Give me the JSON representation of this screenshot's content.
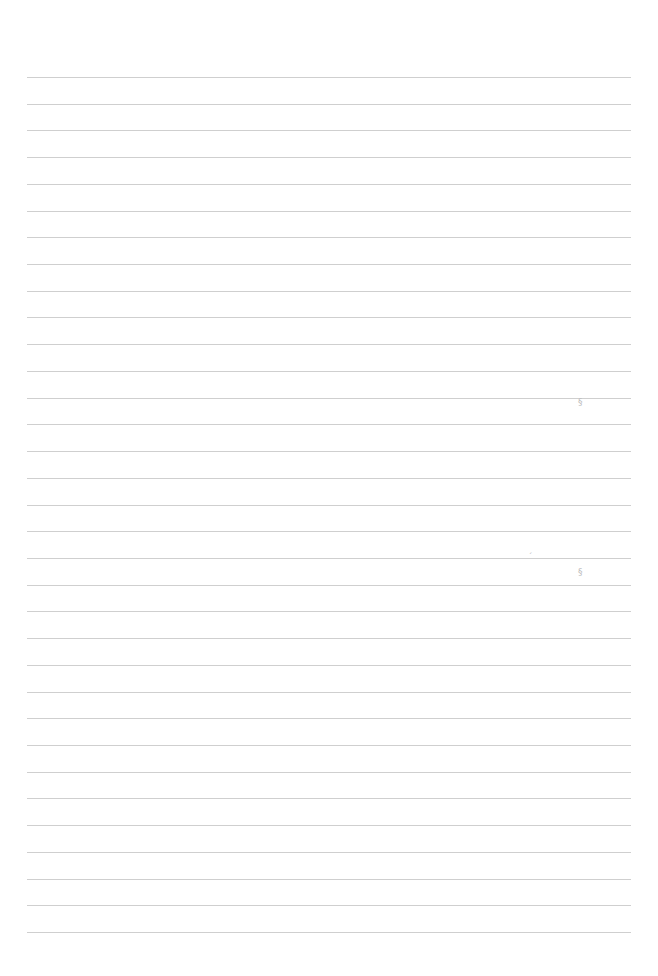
{
  "page": {
    "type": "ruled-paper",
    "background": "#ffffff",
    "rule_color": "#cfcfcf",
    "rule_count": 33,
    "first_rule_y": 77,
    "rule_spacing": 26.72,
    "rule_left": 27,
    "rule_right": 631
  },
  "marks": [
    {
      "name": "faint-mark-1",
      "x": 578,
      "y": 398,
      "text": "§"
    },
    {
      "name": "faint-mark-2",
      "x": 528,
      "y": 553,
      "text": "ˊ"
    },
    {
      "name": "faint-mark-3",
      "x": 578,
      "y": 568,
      "text": "§"
    }
  ]
}
